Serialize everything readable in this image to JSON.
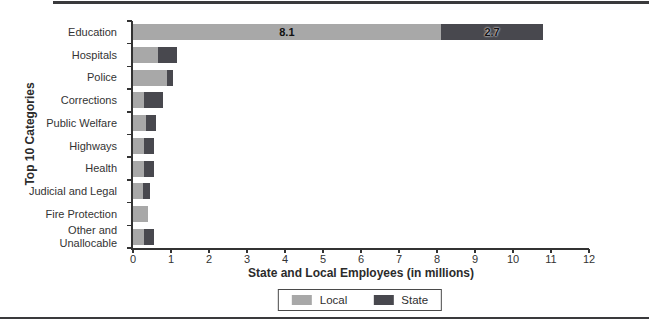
{
  "figure": {
    "background": "#ffffff",
    "top_rule_color": "#3a3a3c",
    "bottom_rule_color": "#3a3a3c",
    "text_color": "#2e2e2e",
    "axis_color": "#333333"
  },
  "chart_data": {
    "type": "bar",
    "orientation": "horizontal",
    "stacked": true,
    "title": "",
    "xlabel": "State and Local Employees (in millions)",
    "ylabel": "Top 10 Categories",
    "xlim": [
      0,
      12
    ],
    "xticks": [
      0,
      1,
      2,
      3,
      4,
      5,
      6,
      7,
      8,
      9,
      10,
      11,
      12
    ],
    "grid": false,
    "legend_position": "bottom-center",
    "categories": [
      "Education",
      "Hospitals",
      "Police",
      "Corrections",
      "Public Welfare",
      "Highways",
      "Health",
      "Judicial and Legal",
      "Fire Protection",
      "Other and Unallocable"
    ],
    "series": [
      {
        "name": "Local",
        "color": "#a8a8a8",
        "values": [
          8.1,
          0.65,
          0.9,
          0.3,
          0.35,
          0.3,
          0.3,
          0.25,
          0.4,
          0.3
        ]
      },
      {
        "name": "State",
        "color": "#48484e",
        "values": [
          2.7,
          0.5,
          0.15,
          0.5,
          0.25,
          0.25,
          0.25,
          0.2,
          0,
          0.25
        ]
      }
    ],
    "data_labels": [
      {
        "category": "Education",
        "series": "Local",
        "text": "8.1"
      },
      {
        "category": "Education",
        "series": "State",
        "text": "2.7"
      }
    ]
  }
}
